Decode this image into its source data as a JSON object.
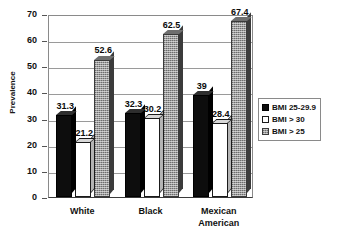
{
  "chart_data": {
    "type": "bar",
    "title": "",
    "xlabel": "",
    "ylabel": "Prevalence",
    "ylim": [
      0,
      70
    ],
    "yticks": [
      0,
      10,
      20,
      30,
      40,
      50,
      60,
      70
    ],
    "ytick_labels": [
      "0",
      "10",
      "20",
      "30",
      "40",
      "50",
      "60",
      "70"
    ],
    "grid": true,
    "legend_position": "right",
    "categories": [
      "White",
      "Black",
      "Mexican American"
    ],
    "category_labels": [
      "White",
      "Black",
      "Mexican\nAmerican"
    ],
    "series": [
      {
        "name": "BMI 25-29.9",
        "color": "#0d0d0d",
        "pattern": "solid-black",
        "values": [
          31.3,
          32.3,
          39
        ],
        "value_labels": [
          "31.3",
          "32.3",
          "39"
        ]
      },
      {
        "name": "BMI > 30",
        "color": "#ffffff",
        "pattern": "solid-white-outlined",
        "values": [
          21.2,
          30.2,
          28.4
        ],
        "value_labels": [
          "21.2",
          "30.2",
          "28.4"
        ]
      },
      {
        "name": "BMI > 25",
        "color": "#9c9c9c",
        "pattern": "gray-stipple",
        "values": [
          52.6,
          62.5,
          67.4
        ],
        "value_labels": [
          "52.6",
          "62.5",
          "67.4"
        ]
      }
    ]
  },
  "legend": {
    "items": [
      {
        "label": "BMI 25-29.9"
      },
      {
        "label": "BMI > 30"
      },
      {
        "label": "BMI > 25"
      }
    ]
  }
}
